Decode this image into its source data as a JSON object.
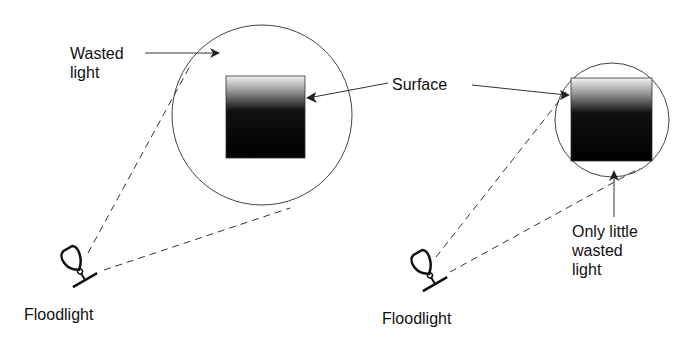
{
  "left": {
    "wasted_label": "Wasted\nlight",
    "surface_label": "Surface",
    "floodlight_label": "Floodlight"
  },
  "right": {
    "wasted_label": "Only little\nwasted\nlight",
    "floodlight_label": "Floodlight"
  },
  "colors": {
    "line": "#333333",
    "surface_top": "#f2f2f2",
    "surface_bottom": "#000000"
  }
}
